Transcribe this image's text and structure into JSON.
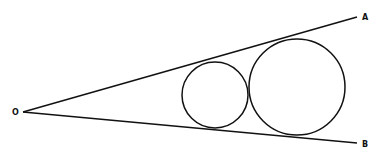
{
  "diagram": {
    "points": {
      "O": {
        "label": "O",
        "x": 23,
        "y": 112
      },
      "A": {
        "label": "A",
        "x": 357,
        "y": 17
      },
      "B": {
        "label": "B",
        "x": 357,
        "y": 143
      }
    },
    "circles": [
      {
        "name": "small",
        "cx": 215,
        "cy": 95,
        "r": 33
      },
      {
        "name": "large",
        "cx": 297,
        "cy": 87,
        "r": 48
      }
    ],
    "stroke_color": "#111111"
  }
}
